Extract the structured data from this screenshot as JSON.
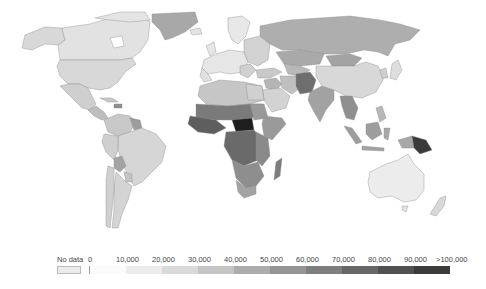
{
  "map": {
    "type": "choropleth",
    "projection": "world",
    "colormap": "grayscale (light = low, dark = high)",
    "regions": {
      "north_america": {
        "canada": "#e2e2e2",
        "usa": "#d8d8d8",
        "alaska": "#d8d8d8",
        "mexico": "#cfcfcf",
        "greenland": "#a8a8a8",
        "central_america": "#bdbdbd",
        "caribbean": "#a8a8a8"
      },
      "south_america": {
        "brazil": "#d6d6d6",
        "colombia": "#cccccc",
        "venezuela": "#c8c8c8",
        "guyana_suriname": "#9c9c9c",
        "peru": "#cfcfcf",
        "bolivia": "#a3a3a3",
        "argentina": "#d4d4d4",
        "chile": "#d0d0d0",
        "paraguay": "#c4c4c4"
      },
      "europe": {
        "western": "#e6e6e6",
        "eastern": "#d2d2d2",
        "scandinavia": "#e8e8e8",
        "iceland": "#e4e4e4"
      },
      "russia": "#aeaeae",
      "central_asia": {
        "kazakhstan": "#a9a9a9",
        "mongolia": "#a3a3a3"
      },
      "middle_east": {
        "turkey": "#c9c9c9",
        "iran": "#c0c0c0",
        "saudi_arabia": "#d3d3d3",
        "iraq_syria": "#b5b5b5",
        "afghanistan_pakistan": "#6e6e6e"
      },
      "south_asia": {
        "india": "#a2a2a2"
      },
      "east_asia": {
        "china": "#d8d8d8",
        "japan": "#dedede",
        "korea": "#cfcfcf"
      },
      "southeast_asia": {
        "indochina": "#8f8f8f",
        "indonesia": "#9d9d9d",
        "philippines": "#b8b8b8",
        "papua_new_guinea": "#3a3a3a"
      },
      "africa": {
        "north": "#c6c6c6",
        "sahel": "#7a7a7a",
        "west": "#5e5e5e",
        "central_african_republic": "#1e1e1e",
        "congo_basin": "#6a6a6a",
        "east": "#8a8a8a",
        "horn": "#9a9a9a",
        "south": "#8e8e8e",
        "south_africa": "#a3a3a3",
        "madagascar": "#7c7c7c"
      },
      "oceania": {
        "australia": "#ececec",
        "new_zealand": "#d8d8d8"
      }
    }
  },
  "legend": {
    "no_data_label": "No data",
    "no_data_color": "#ebebeb",
    "ticks": [
      "0",
      "10,000",
      "20,000",
      "30,000",
      "40,000",
      "50,000",
      "60,000",
      "70,000",
      "80,000",
      "90,000",
      ">100,000"
    ],
    "ramp_colors": [
      "#fbfbfb",
      "#ececec",
      "#d9d9d9",
      "#c4c4c4",
      "#acacac",
      "#959595",
      "#7e7e7e",
      "#676767",
      "#515151",
      "#3b3b3b"
    ]
  }
}
